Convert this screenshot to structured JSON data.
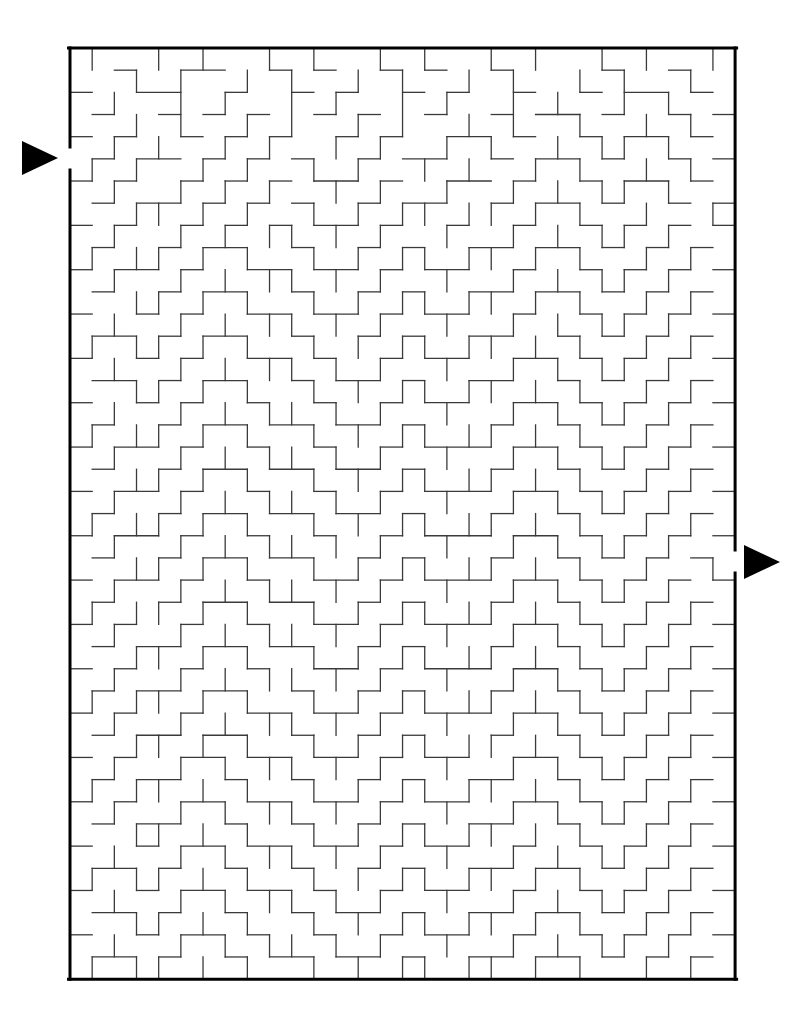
{
  "page": {
    "background_color": "#ffffff",
    "width": 809,
    "height": 1023
  },
  "maze": {
    "kind": "rectangular-perfect-maze",
    "columns": 30,
    "rows": 42,
    "cell_size": 22.17,
    "origin_x": 70,
    "origin_y": 48,
    "border_color": "#000000",
    "wall_color": "#3a3a3a",
    "border_width": 3,
    "wall_width": 1.3,
    "entrance": {
      "label": "entrance",
      "side": "left",
      "row": 4,
      "gap_y_start": 147,
      "gap_y_end": 170
    },
    "exit": {
      "label": "exit",
      "side": "right",
      "row": 23,
      "gap_y_start": 550,
      "gap_y_end": 573
    },
    "arrows": [
      {
        "name": "entrance-arrow",
        "direction": "right",
        "color": "#000000",
        "x": 22,
        "y": 141,
        "width": 36,
        "height": 34
      },
      {
        "name": "exit-arrow",
        "direction": "right",
        "color": "#000000",
        "x": 744,
        "y": 545,
        "width": 36,
        "height": 34
      }
    ],
    "h_walls": [
      "000000000000000000000000000000",
      "001001100101001010010000100100",
      "100110010010100101001001011010",
      "010010101001010010010110100101",
      "101001010100101001101001011010",
      "010110101010010110010110100101",
      "101001010101101001101001011010",
      "010110101010010110010110100101",
      "101001010101101001001001010101",
      "010010110010010100110110101010",
      "101101001101101011001001010101",
      "010010110010010100110110101010",
      "100101001101101011001001010101",
      "011010110010010100110010101010",
      "100101001101001011001101010101",
      "011010110010110100110010101010",
      "100101001001001011001101010101",
      "010010110110110100010010101010",
      "101101001001001011101101010101",
      "010010110110110100010010101010",
      "101101001001001011101101010101",
      "010010110110110100010010101010",
      "101101001001001011101101010101",
      "010010110110010100010010101010",
      "101101001001101011101101010101",
      "010010110110010100010010101010",
      "101001001001101011101101010101",
      "010110110110010100010010101010",
      "101001001001101011101101010101",
      "010110110010010100010010101010",
      "101001001101101011101101010101",
      "010110110010010100010010101010",
      "101001101101101011001101010101",
      "010110010010010100110010101010",
      "101001101101101011001101010101",
      "010110010010010100110010101010",
      "100101101101101011001001010101",
      "011010010010010100110110101010",
      "100101101101001011001001010101",
      "011010010010110100110110101010",
      "100101101001001011001001010101",
      "011010010110110100110110101010",
      "000000000000000000000000000000"
    ],
    "v_walls": [
      "0100101001010010100101001010010",
      "1001010010100101001010010100101",
      "1010010100101001010010100101001",
      "1001010010100101001010010010101",
      "0010100101001010010100101101001",
      "1101001010010100101001010010101",
      "1010010101001010010010101101001",
      "1001101010010101101101010010011",
      "1010010101101010010010101101001",
      "1101101010010101101101010010101",
      "1010010101101010010010101101001",
      "1001101010010101101101010010101",
      "1010010101101010010010101101001",
      "1101101010010101101101010010101",
      "1010010101101010010010101101001",
      "1001101010010101101101010010101",
      "1010010101101010010010101101001",
      "1101101010010101101101010010101",
      "1010010101101010010010101101001",
      "1001101010010101101101010010101",
      "1010010101101010010010101101001",
      "1101101010010101101101010010101",
      "1010010101101010010010101101001",
      "1001101010010101101101010010010",
      "1010010101101010010010101101001",
      "1101101010010101101101010010101",
      "1010010101101010010010101101001",
      "1001101010010101101101010010101",
      "1010010101101010010010101101001",
      "1101101010010101101101010010101",
      "1010010101101010010010101101001",
      "1001101010010101101101010010101",
      "1010010101101010010010101101001",
      "1101101010010101101101010010101",
      "1010010101101010010010101101001",
      "1001101010010101101101010010101",
      "1010010101101010010010101101001",
      "1101101010010101101101010010101",
      "1010010101101010010010101101001",
      "1001101010010101101101010010101",
      "1010010101101010010010101101001",
      "1101101010010101101101010010101"
    ]
  }
}
